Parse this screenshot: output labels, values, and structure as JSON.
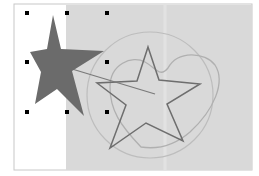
{
  "canvas": {
    "width": 259,
    "height": 176,
    "page_color": "#ffffff",
    "page_border_color": "#c8c8c8",
    "page": {
      "x": 14,
      "y": 4,
      "w": 238,
      "h": 166
    },
    "gray_region": {
      "x": 66,
      "y": 4,
      "w": 186,
      "h": 166,
      "color": "#d9d9d9"
    }
  },
  "shapes": {
    "filled_star": {
      "label": "filled star (selected)",
      "fill": "#6b6b6b"
    },
    "outline_star": {
      "label": "outlined star",
      "stroke": "#6e6e6e"
    },
    "circle": {
      "label": "circle outline",
      "stroke": "#bdbdbd"
    },
    "heart": {
      "label": "heart outline",
      "stroke": "#b0b0b0"
    },
    "line": {
      "label": "connector line",
      "stroke": "#7a7a7a"
    }
  },
  "selection": {
    "handle_color": "#000000",
    "handles": [
      {
        "x": 27,
        "y": 13
      },
      {
        "x": 67,
        "y": 13
      },
      {
        "x": 107,
        "y": 13
      },
      {
        "x": 27,
        "y": 62
      },
      {
        "x": 107,
        "y": 62
      },
      {
        "x": 27,
        "y": 112
      },
      {
        "x": 67,
        "y": 112
      },
      {
        "x": 107,
        "y": 112
      }
    ]
  }
}
